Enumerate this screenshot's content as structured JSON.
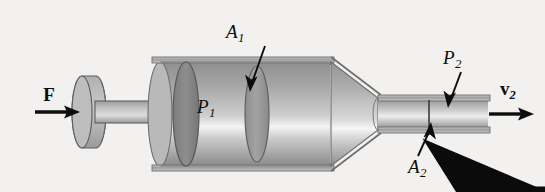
{
  "figure": {
    "background_color": "#f2f1ef",
    "ink_color": "#111111",
    "labels": {
      "force": {
        "symbol": "F",
        "subscript": "",
        "accent": "vector-arrow",
        "bold": true
      },
      "area_large": {
        "symbol": "A",
        "subscript": "1",
        "accent": "none",
        "bold": false
      },
      "pressure_large": {
        "symbol": "P",
        "subscript": "1",
        "accent": "none",
        "bold": false
      },
      "pressure_small": {
        "symbol": "P",
        "subscript": "2",
        "accent": "none",
        "bold": false
      },
      "area_small": {
        "symbol": "A",
        "subscript": "2",
        "accent": "none",
        "bold": false
      },
      "velocity_out": {
        "symbol": "v",
        "subscript": "2",
        "accent": "vector-arrow",
        "bold": true
      }
    },
    "parts": [
      {
        "name": "piston-handle-knob",
        "description": "cylindrical grip at the left end of the piston rod"
      },
      {
        "name": "piston-rod",
        "description": "horizontal shaft connecting the handle to the piston face"
      },
      {
        "name": "piston-face-disk",
        "description": "dark elliptical piston head inside the wide cylinder"
      },
      {
        "name": "wide-cylinder-barrel",
        "description": "large-diameter shaded barrel holding the fluid"
      },
      {
        "name": "cross-section-disk-A1",
        "description": "elliptical cross-section marked by the A1 arrow"
      },
      {
        "name": "hidden-edge-dashed-ellipse",
        "description": "dashed curve showing the far rim of the barrel"
      },
      {
        "name": "converging-nozzle-cone",
        "description": "tapered section reducing the barrel to the outlet tube"
      },
      {
        "name": "outlet-tube",
        "description": "narrow straight tube carrying the exiting fluid"
      },
      {
        "name": "cross-section-line-A2",
        "description": "short vertical line across the outlet tube marking A2"
      }
    ],
    "arrows": [
      {
        "name": "force-arrow",
        "direction": "right",
        "points_to": "piston-handle-knob"
      },
      {
        "name": "area-large-leader-arrow",
        "direction": "down-left",
        "points_to": "cross-section-disk-A1"
      },
      {
        "name": "pressure-small-leader-arrow",
        "direction": "down-left",
        "points_to": "outlet-tube"
      },
      {
        "name": "area-small-leader-arrow",
        "direction": "up-right",
        "points_to": "cross-section-line-A2"
      },
      {
        "name": "velocity-arrow",
        "direction": "right",
        "points_to": "outlet-flow"
      }
    ]
  }
}
